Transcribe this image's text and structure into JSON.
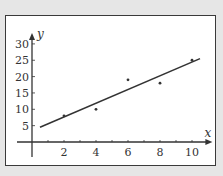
{
  "chart_data": {
    "type": "scatter",
    "title": "",
    "xlabel": "x",
    "ylabel": "y",
    "xlim": [
      0,
      10.5
    ],
    "ylim": [
      0,
      30
    ],
    "x_ticks": [
      2,
      4,
      6,
      8,
      10
    ],
    "y_ticks": [
      5,
      10,
      15,
      20,
      25,
      30
    ],
    "grid": false,
    "legend": null,
    "series": [
      {
        "name": "data points",
        "type": "scatter",
        "x": [
          2,
          4,
          6,
          8,
          10
        ],
        "y": [
          8,
          10,
          19,
          18,
          25
        ]
      },
      {
        "name": "line of best fit",
        "type": "line",
        "x": [
          0.5,
          10.5
        ],
        "y": [
          4.5,
          25.5
        ]
      }
    ]
  },
  "axes": {
    "x_label": "x",
    "y_label": "y",
    "x_tick_labels": [
      "2",
      "4",
      "6",
      "8",
      "10"
    ],
    "y_tick_labels": [
      "5",
      "10",
      "15",
      "20",
      "25",
      "30"
    ]
  },
  "colors": {
    "background": "#e6e6e6",
    "panel": "#ffffff",
    "ink": "#333333"
  }
}
